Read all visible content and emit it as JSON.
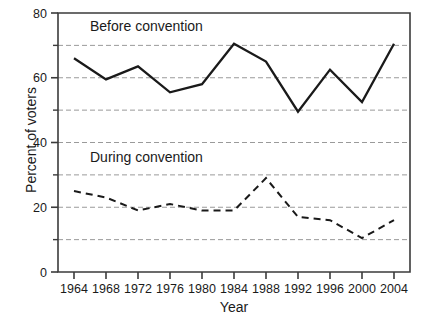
{
  "chart_data": {
    "type": "line",
    "title": "",
    "xlabel": "Year",
    "ylabel": "Percent of voters",
    "x": [
      1964,
      1968,
      1972,
      1976,
      1980,
      1984,
      1988,
      1992,
      1996,
      2000,
      2004
    ],
    "xticklabels": [
      "1964",
      "1968",
      "1972",
      "1976",
      "1980",
      "1984",
      "1988",
      "1992",
      "1996",
      "2000",
      "2004"
    ],
    "yticklabels": [
      "0",
      "20",
      "40",
      "60",
      "80"
    ],
    "ytickvalues": [
      0,
      20,
      40,
      60,
      80
    ],
    "yminorticks": [
      10,
      30,
      50,
      70
    ],
    "gridlines": [
      10,
      20,
      30,
      40,
      50,
      60,
      70
    ],
    "grid": true,
    "xlim": [
      1962,
      2006
    ],
    "ylim": [
      0,
      80
    ],
    "legend_position": "inline-annotation",
    "series": [
      {
        "name": "Before convention",
        "style": "solid",
        "color": "#1a1a1a",
        "label_x": 1966.0,
        "label_y": 74.5,
        "values": [
          66.0,
          59.5,
          63.5,
          55.5,
          58.0,
          70.5,
          65.0,
          49.5,
          62.5,
          52.5,
          70.5
        ]
      },
      {
        "name": "During convention",
        "style": "dashed",
        "color": "#1a1a1a",
        "label_x": 1966.0,
        "label_y": 34.0,
        "values": [
          25.0,
          23.0,
          19.0,
          21.0,
          19.0,
          19.0,
          29.0,
          17.0,
          16.0,
          10.5,
          16.0
        ]
      }
    ],
    "colors": {
      "axis": "#3b3b3b",
      "grid": "#9a9a9a",
      "line": "#1a1a1a",
      "background": "#ffffff"
    }
  }
}
